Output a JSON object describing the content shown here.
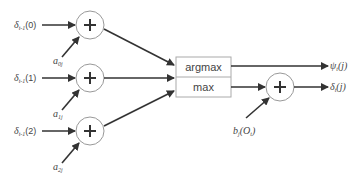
{
  "diagram": {
    "inputs": [
      {
        "delta_label": "δ",
        "delta_sub": "t-1",
        "delta_arg": "(0)",
        "a_label": "a",
        "a_sub": "0j"
      },
      {
        "delta_label": "δ",
        "delta_sub": "t-1",
        "delta_arg": "(1)",
        "a_label": "a",
        "a_sub": "1j"
      },
      {
        "delta_label": "δ",
        "delta_sub": "t-1",
        "delta_arg": "(2)",
        "a_label": "a",
        "a_sub": "2j"
      }
    ],
    "adder_symbol": "+",
    "box": {
      "top_label": "argmax",
      "bottom_label": "max"
    },
    "outputs": {
      "psi_label": "ψ",
      "psi_sub": "t",
      "psi_arg": "(j)",
      "delta_label": "δ",
      "delta_sub": "t",
      "delta_arg": "(j)"
    },
    "emission": {
      "label": "b",
      "sub": "j",
      "arg_open": "(O",
      "arg_sub": "t",
      "arg_close": ")"
    },
    "colors": {
      "stroke": "#333333",
      "circle": "#999999",
      "box_border": "#aaaaaa",
      "text": "#444444"
    }
  }
}
